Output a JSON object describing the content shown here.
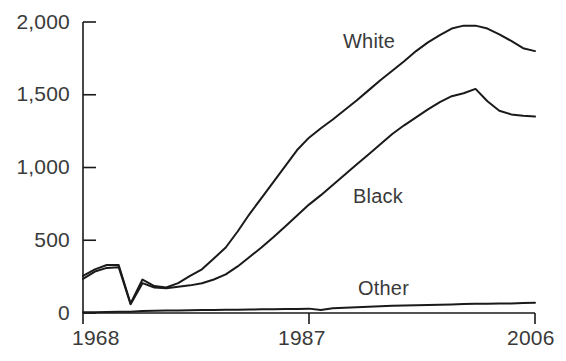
{
  "chart_data": {
    "type": "line",
    "title": "",
    "subtitle": "",
    "xlabel": "",
    "ylabel": "",
    "xlim": [
      1968,
      2006
    ],
    "ylim": [
      0,
      2000
    ],
    "grid": false,
    "legend_position": "inline-annotations",
    "x_ticks": [
      "1968",
      "1987",
      "2006"
    ],
    "x_tick_values": [
      1968,
      1987,
      2006
    ],
    "y_ticks": [
      "0",
      "500",
      "1,000",
      "1,500",
      "2,000"
    ],
    "y_tick_values": [
      0,
      500,
      1000,
      1500,
      2000
    ],
    "x": [
      1968,
      1969,
      1970,
      1971,
      1972,
      1973,
      1974,
      1975,
      1976,
      1977,
      1978,
      1979,
      1980,
      1981,
      1982,
      1983,
      1984,
      1985,
      1986,
      1987,
      1988,
      1989,
      1990,
      1991,
      1992,
      1993,
      1994,
      1995,
      1996,
      1997,
      1998,
      1999,
      2000,
      2001,
      2002,
      2003,
      2004,
      2005,
      2006
    ],
    "series": [
      {
        "name": "White",
        "color": "#1a1a1a",
        "values": [
          255,
          300,
          330,
          330,
          65,
          230,
          185,
          175,
          205,
          255,
          300,
          375,
          450,
          560,
          680,
          790,
          900,
          1010,
          1120,
          1205,
          1270,
          1330,
          1395,
          1460,
          1530,
          1600,
          1665,
          1730,
          1800,
          1860,
          1910,
          1955,
          1975,
          1975,
          1955,
          1915,
          1870,
          1820,
          1800
        ]
      },
      {
        "name": "Black",
        "color": "#1a1a1a",
        "values": [
          235,
          285,
          310,
          315,
          60,
          205,
          175,
          170,
          180,
          190,
          205,
          230,
          265,
          320,
          385,
          450,
          520,
          595,
          670,
          745,
          810,
          880,
          950,
          1020,
          1090,
          1160,
          1230,
          1290,
          1345,
          1400,
          1450,
          1490,
          1510,
          1540,
          1455,
          1390,
          1365,
          1355,
          1350
        ]
      },
      {
        "name": "Other",
        "color": "#1a1a1a",
        "values": [
          5,
          6,
          7,
          8,
          8,
          14,
          16,
          17,
          18,
          19,
          20,
          21,
          22,
          23,
          24,
          25,
          26,
          27,
          28,
          30,
          20,
          32,
          36,
          40,
          43,
          46,
          49,
          51,
          53,
          55,
          57,
          59,
          61,
          63,
          64,
          65,
          66,
          68,
          70
        ]
      }
    ],
    "annotations": [
      {
        "text": "White",
        "x_px": 343,
        "y_px": 30
      },
      {
        "text": "Black",
        "x_px": 353,
        "y_px": 185
      },
      {
        "text": "Other",
        "x_px": 358,
        "y_px": 277
      }
    ],
    "axis": {
      "line_color": "#1a1a1a",
      "y_axis_x_px": 83,
      "x_axis_y_px": 313,
      "plot_right_px": 535,
      "plot_top_px": 22
    }
  }
}
